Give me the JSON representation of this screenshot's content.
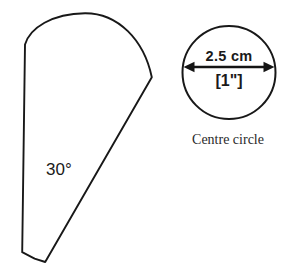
{
  "diagram": {
    "wedge": {
      "angle_label": "30°"
    },
    "circle": {
      "dimension_metric": "2.5  cm",
      "dimension_imperial": "[1\"]",
      "caption": "Centre circle"
    }
  },
  "colors": {
    "stroke": "#181818",
    "background": "#ffffff",
    "text": "#1a1a1a",
    "caption_text": "#2a2a2a"
  }
}
